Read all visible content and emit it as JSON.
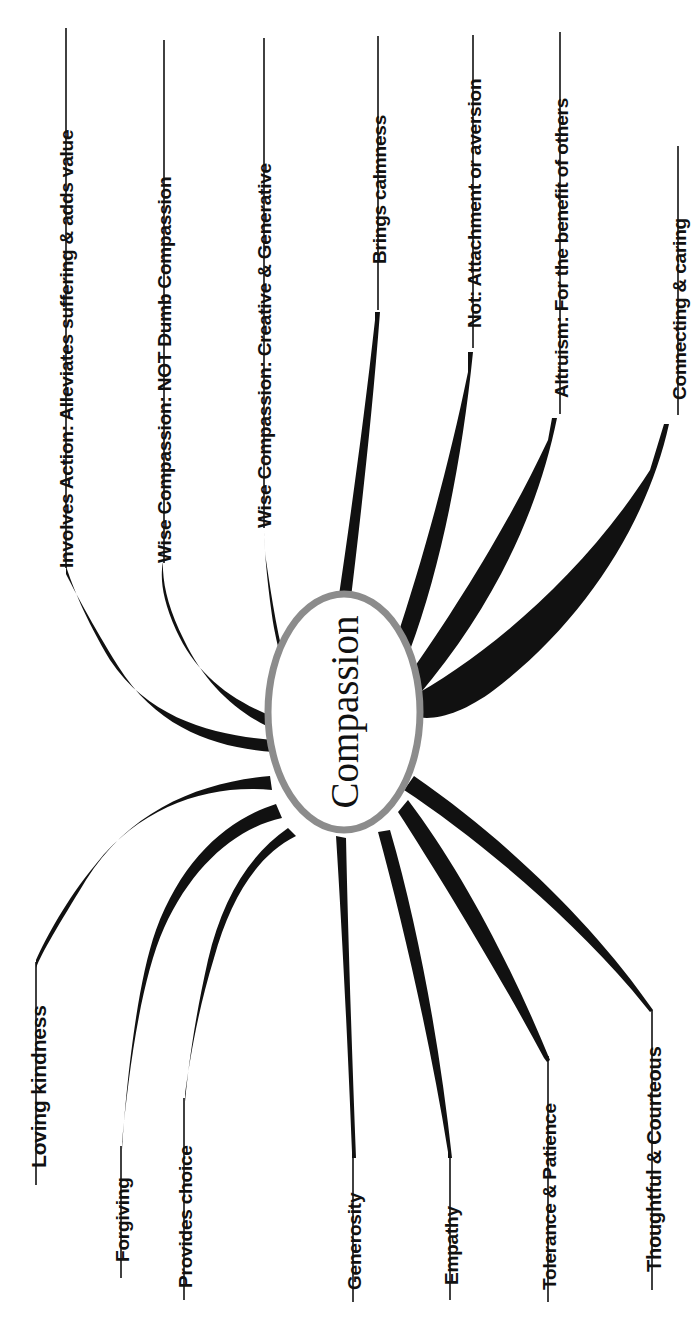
{
  "diagram": {
    "type": "mind-map",
    "orientation": "rotated-90-ccw",
    "center": {
      "label": "Compassion",
      "shape": "ellipse",
      "border_color": "#8c8c8c",
      "fill_color": "#ffffff",
      "text_color": "#111111"
    },
    "branch_color": "#111111",
    "background_color": "#ffffff",
    "branches": [
      {
        "id": "involves-action",
        "label": "Involves Action: Alleviates suffering & adds value",
        "side": "top",
        "font_size": 19,
        "label_x": 57,
        "label_y": 568,
        "rule_x": 66,
        "rule_y1": 28,
        "rule_y2": 568
      },
      {
        "id": "wise-compassion-not-dumb",
        "label": "Wise Compassion: NOT Dumb Compassion",
        "side": "top",
        "font_size": 19,
        "label_x": 155,
        "label_y": 563,
        "rule_x": 164,
        "rule_y1": 40,
        "rule_y2": 563
      },
      {
        "id": "wise-compassion-creative",
        "label": "Wise Compassion: Creative & Generative",
        "side": "top",
        "font_size": 19,
        "label_x": 255,
        "label_y": 528,
        "rule_x": 264,
        "rule_y1": 38,
        "rule_y2": 528
      },
      {
        "id": "brings-calmness",
        "label": "Brings calmness",
        "side": "top",
        "font_size": 19,
        "label_x": 370,
        "label_y": 264,
        "rule_x": 378,
        "rule_y1": 36,
        "rule_y2": 310
      },
      {
        "id": "not-attachment-aversion",
        "label": "Not: Attachment or aversion",
        "side": "top",
        "font_size": 19,
        "label_x": 465,
        "label_y": 328,
        "rule_x": 473,
        "rule_y1": 35,
        "rule_y2": 348
      },
      {
        "id": "altruism-benefit-others",
        "label": "Altruism: For the benefit of others",
        "side": "top",
        "font_size": 19,
        "label_x": 552,
        "label_y": 398,
        "rule_x": 560,
        "rule_y1": 32,
        "rule_y2": 414
      },
      {
        "id": "connecting-caring",
        "label": "Connecting & caring",
        "side": "top",
        "font_size": 19,
        "label_x": 670,
        "label_y": 400,
        "rule_x": 678,
        "rule_y1": 146,
        "rule_y2": 415
      },
      {
        "id": "loving-kindness",
        "label": "Loving kindness",
        "side": "bottom",
        "font_size": 21,
        "label_x": 28,
        "label_y": 1168,
        "rule_x": 36,
        "rule_y1": 962,
        "rule_y2": 1185
      },
      {
        "id": "forgiving",
        "label": "Forgiving",
        "side": "bottom",
        "font_size": 19,
        "label_x": 113,
        "label_y": 1262,
        "rule_x": 121,
        "rule_y1": 1146,
        "rule_y2": 1278
      },
      {
        "id": "provides-choice",
        "label": "Provides choice",
        "side": "bottom",
        "font_size": 19,
        "label_x": 176,
        "label_y": 1288,
        "rule_x": 184,
        "rule_y1": 1098,
        "rule_y2": 1300
      },
      {
        "id": "generosity",
        "label": "Generosity",
        "side": "bottom",
        "font_size": 19,
        "label_x": 345,
        "label_y": 1290,
        "rule_x": 353,
        "rule_y1": 1152,
        "rule_y2": 1302
      },
      {
        "id": "empathy",
        "label": "Empathy",
        "side": "bottom",
        "font_size": 19,
        "label_x": 442,
        "label_y": 1285,
        "rule_x": 450,
        "rule_y1": 1154,
        "rule_y2": 1300
      },
      {
        "id": "tolerance-patience",
        "label": "Tolerance & Patience",
        "side": "bottom",
        "font_size": 19,
        "label_x": 540,
        "label_y": 1290,
        "rule_x": 548,
        "rule_y1": 1056,
        "rule_y2": 1302
      },
      {
        "id": "thoughtful-courteous",
        "label": "Thoughtful & Courteous",
        "side": "bottom",
        "font_size": 20,
        "label_x": 644,
        "label_y": 1272,
        "rule_x": 652,
        "rule_y1": 1010,
        "rule_y2": 1290
      }
    ]
  }
}
